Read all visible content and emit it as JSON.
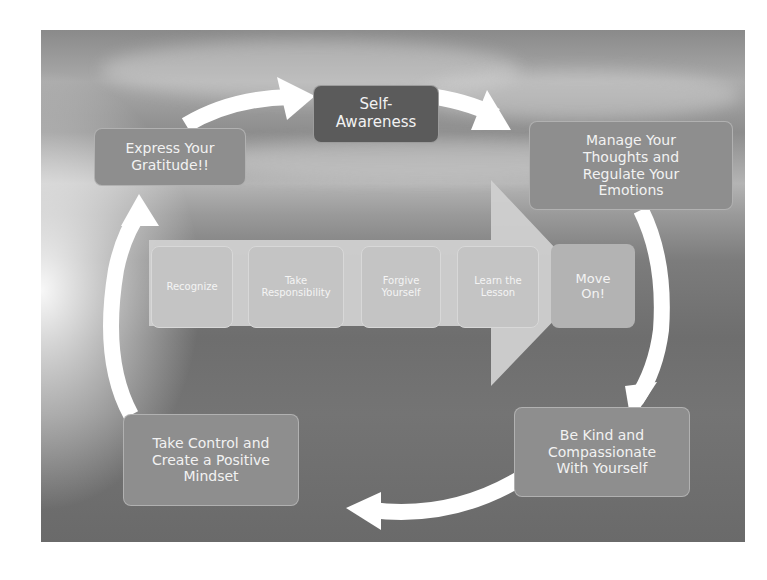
{
  "diagram": {
    "center": {
      "label": "Self-\nAwareness",
      "line1": "Self-",
      "line2": "Awareness"
    },
    "cycle_nodes": [
      {
        "id": "manage",
        "lines": [
          "Manage Your",
          "Thoughts and",
          "Regulate Your",
          "Emotions"
        ]
      },
      {
        "id": "kind",
        "lines": [
          "Be Kind and",
          "Compassionate",
          "With Yourself"
        ]
      },
      {
        "id": "control",
        "lines": [
          "Take Control and",
          "Create a Positive",
          "Mindset"
        ]
      },
      {
        "id": "gratitude",
        "lines": [
          "Express Your",
          "Gratitude!!"
        ]
      }
    ],
    "process_steps": [
      {
        "lines": [
          "Recognize"
        ]
      },
      {
        "lines": [
          "Take",
          "Responsibility"
        ]
      },
      {
        "lines": [
          "Forgive",
          "Yourself"
        ]
      },
      {
        "lines": [
          "Learn the",
          "Lesson"
        ]
      },
      {
        "lines": [
          "Move",
          "On!"
        ]
      }
    ],
    "colors": {
      "cycle_arrow": "#ffffff",
      "center_box": "#5b5b5b",
      "outer_box": "#8e8e8e",
      "step_box": "#c4c4c4",
      "big_arrow": "#d0d0d0"
    }
  }
}
